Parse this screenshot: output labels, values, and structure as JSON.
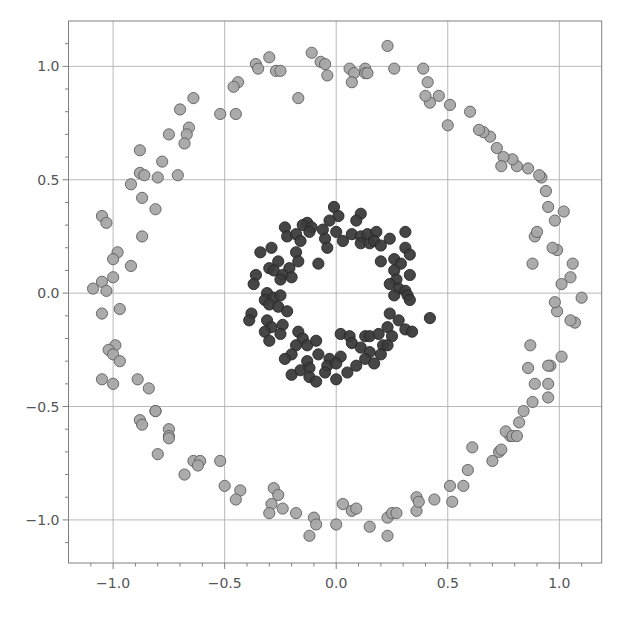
{
  "chart_data": {
    "type": "scatter",
    "title": "",
    "xlabel": "",
    "ylabel": "",
    "xlim": [
      -1.2,
      1.19
    ],
    "ylim": [
      -1.19,
      1.2
    ],
    "grid": true,
    "legend": null,
    "xticks": [
      -1.0,
      -0.5,
      0.0,
      0.5,
      1.0
    ],
    "xtick_labels": [
      "−1.0",
      "−0.5",
      "0.0",
      "0.5",
      "1.0"
    ],
    "yticks": [
      1.0,
      0.5,
      0.0,
      -0.5,
      -1.0
    ],
    "ytick_labels": [
      "1.0",
      "0.5",
      "0.0",
      "−0.5",
      "−1.0"
    ],
    "colors": {
      "outer": "#a6a6a6",
      "outer_edge": "#5e5e5e",
      "inner": "#3c3c3c",
      "inner_edge": "#262626",
      "grid": "#b0b0b0",
      "axis": "#808080",
      "tick_label": "#555555"
    },
    "series": [
      {
        "name": "outer circle",
        "points": [
          [
            -0.3,
            1.04
          ],
          [
            -0.11,
            1.06
          ],
          [
            -0.36,
            1.01
          ],
          [
            -0.35,
            0.99
          ],
          [
            -0.27,
            0.98
          ],
          [
            -0.25,
            0.98
          ],
          [
            -0.07,
            1.02
          ],
          [
            -0.05,
            1.01
          ],
          [
            -0.04,
            0.96
          ],
          [
            -0.17,
            0.86
          ],
          [
            -0.44,
            0.93
          ],
          [
            -0.46,
            0.91
          ],
          [
            -0.45,
            0.79
          ],
          [
            -0.52,
            0.79
          ],
          [
            -0.64,
            0.86
          ],
          [
            -0.7,
            0.81
          ],
          [
            -0.66,
            0.73
          ],
          [
            -0.67,
            0.7
          ],
          [
            -0.68,
            0.66
          ],
          [
            -0.75,
            0.7
          ],
          [
            -0.88,
            0.63
          ],
          [
            -0.78,
            0.58
          ],
          [
            -0.88,
            0.53
          ],
          [
            -0.86,
            0.52
          ],
          [
            -0.8,
            0.51
          ],
          [
            -0.71,
            0.52
          ],
          [
            -0.92,
            0.48
          ],
          [
            -0.87,
            0.42
          ],
          [
            -0.81,
            0.37
          ],
          [
            -1.05,
            0.34
          ],
          [
            -1.03,
            0.31
          ],
          [
            -0.87,
            0.25
          ],
          [
            -0.98,
            0.18
          ],
          [
            -1.0,
            0.15
          ],
          [
            -0.92,
            0.12
          ],
          [
            -1.0,
            0.07
          ],
          [
            -1.05,
            0.05
          ],
          [
            -1.09,
            0.02
          ],
          [
            -1.03,
            0.01
          ],
          [
            -0.97,
            -0.07
          ],
          [
            -1.05,
            -0.09
          ],
          [
            -0.99,
            -0.23
          ],
          [
            -1.02,
            -0.25
          ],
          [
            -1.0,
            -0.27
          ],
          [
            -0.97,
            -0.3
          ],
          [
            -1.05,
            -0.38
          ],
          [
            -1.0,
            -0.4
          ],
          [
            -0.89,
            -0.38
          ],
          [
            -0.84,
            -0.42
          ],
          [
            -0.81,
            -0.52
          ],
          [
            -0.81,
            -0.52
          ],
          [
            -0.88,
            -0.56
          ],
          [
            -0.87,
            -0.58
          ],
          [
            -0.75,
            -0.6
          ],
          [
            -0.75,
            -0.63
          ],
          [
            -0.75,
            -0.64
          ],
          [
            -0.8,
            -0.71
          ],
          [
            -0.64,
            -0.74
          ],
          [
            -0.61,
            -0.74
          ],
          [
            -0.62,
            -0.76
          ],
          [
            -0.52,
            -0.74
          ],
          [
            -0.68,
            -0.8
          ],
          [
            -0.5,
            -0.85
          ],
          [
            -0.43,
            -0.87
          ],
          [
            -0.45,
            -0.91
          ],
          [
            -0.28,
            -0.86
          ],
          [
            -0.26,
            -0.89
          ],
          [
            -0.29,
            -0.93
          ],
          [
            -0.3,
            -0.97
          ],
          [
            -0.24,
            -0.95
          ],
          [
            -0.18,
            -0.97
          ],
          [
            -0.1,
            -0.99
          ],
          [
            -0.09,
            -1.02
          ],
          [
            -0.12,
            -1.07
          ],
          [
            0.0,
            -1.02
          ],
          [
            0.03,
            -0.93
          ],
          [
            0.07,
            -0.96
          ],
          [
            0.09,
            -0.95
          ],
          [
            0.15,
            -1.03
          ],
          [
            0.23,
            -0.99
          ],
          [
            0.25,
            -0.97
          ],
          [
            0.27,
            -0.97
          ],
          [
            0.23,
            -1.07
          ],
          [
            0.36,
            -0.96
          ],
          [
            0.36,
            -0.9
          ],
          [
            0.37,
            -0.92
          ],
          [
            0.44,
            -0.91
          ],
          [
            0.51,
            -0.85
          ],
          [
            0.52,
            -0.92
          ],
          [
            0.57,
            -0.85
          ],
          [
            0.59,
            -0.78
          ],
          [
            0.61,
            -0.68
          ],
          [
            0.7,
            -0.74
          ],
          [
            0.73,
            -0.7
          ],
          [
            0.74,
            -0.69
          ],
          [
            0.78,
            -0.63
          ],
          [
            0.76,
            -0.61
          ],
          [
            0.79,
            -0.63
          ],
          [
            0.81,
            -0.63
          ],
          [
            0.82,
            -0.57
          ],
          [
            0.84,
            -0.52
          ],
          [
            0.88,
            -0.48
          ],
          [
            0.95,
            -0.46
          ],
          [
            0.95,
            -0.4
          ],
          [
            0.89,
            -0.4
          ],
          [
            0.86,
            -0.33
          ],
          [
            0.96,
            -0.32
          ],
          [
            1.01,
            -0.28
          ],
          [
            0.95,
            -0.32
          ],
          [
            0.87,
            -0.23
          ],
          [
            1.07,
            -0.13
          ],
          [
            1.05,
            -0.12
          ],
          [
            0.99,
            -0.08
          ],
          [
            0.98,
            -0.04
          ],
          [
            1.1,
            -0.02
          ],
          [
            1.01,
            0.04
          ],
          [
            1.05,
            0.07
          ],
          [
            1.06,
            0.13
          ],
          [
            0.88,
            0.13
          ],
          [
            0.99,
            0.19
          ],
          [
            0.97,
            0.2
          ],
          [
            0.89,
            0.25
          ],
          [
            0.9,
            0.27
          ],
          [
            0.98,
            0.32
          ],
          [
            1.02,
            0.36
          ],
          [
            0.95,
            0.38
          ],
          [
            0.94,
            0.45
          ],
          [
            0.92,
            0.51
          ],
          [
            0.91,
            0.52
          ],
          [
            0.86,
            0.55
          ],
          [
            0.81,
            0.56
          ],
          [
            0.79,
            0.59
          ],
          [
            0.75,
            0.6
          ],
          [
            0.74,
            0.56
          ],
          [
            0.72,
            0.64
          ],
          [
            0.69,
            0.69
          ],
          [
            0.66,
            0.71
          ],
          [
            0.64,
            0.72
          ],
          [
            0.6,
            0.8
          ],
          [
            0.51,
            0.83
          ],
          [
            0.46,
            0.87
          ],
          [
            0.42,
            0.84
          ],
          [
            0.4,
            0.87
          ],
          [
            0.5,
            0.74
          ],
          [
            0.41,
            0.93
          ],
          [
            0.39,
            0.99
          ],
          [
            0.26,
            0.99
          ],
          [
            0.13,
            0.99
          ],
          [
            0.23,
            1.09
          ],
          [
            0.06,
            0.99
          ],
          [
            0.08,
            0.97
          ],
          [
            0.13,
            0.97
          ],
          [
            0.14,
            0.97
          ],
          [
            0.07,
            0.93
          ]
        ]
      },
      {
        "name": "inner circle",
        "points": [
          [
            -0.01,
            0.38
          ],
          [
            0.01,
            0.34
          ],
          [
            -0.03,
            0.32
          ],
          [
            0.11,
            0.35
          ],
          [
            0.09,
            0.32
          ],
          [
            -0.13,
            0.31
          ],
          [
            -0.15,
            0.3
          ],
          [
            -0.23,
            0.29
          ],
          [
            -0.11,
            0.29
          ],
          [
            -0.06,
            0.28
          ],
          [
            -0.22,
            0.25
          ],
          [
            -0.18,
            0.26
          ],
          [
            -0.16,
            0.23
          ],
          [
            -0.12,
            0.27
          ],
          [
            -0.05,
            0.24
          ],
          [
            -0.04,
            0.2
          ],
          [
            0.0,
            0.27
          ],
          [
            0.03,
            0.23
          ],
          [
            0.07,
            0.26
          ],
          [
            0.11,
            0.25
          ],
          [
            0.14,
            0.26
          ],
          [
            0.18,
            0.27
          ],
          [
            0.24,
            0.24
          ],
          [
            0.31,
            0.27
          ],
          [
            0.11,
            0.22
          ],
          [
            0.15,
            0.22
          ],
          [
            0.17,
            0.23
          ],
          [
            0.2,
            0.21
          ],
          [
            0.31,
            0.2
          ],
          [
            0.33,
            0.17
          ],
          [
            -0.29,
            0.2
          ],
          [
            -0.34,
            0.18
          ],
          [
            -0.18,
            0.18
          ],
          [
            -0.17,
            0.14
          ],
          [
            -0.08,
            0.13
          ],
          [
            -0.26,
            0.14
          ],
          [
            0.2,
            0.14
          ],
          [
            0.26,
            0.15
          ],
          [
            0.29,
            0.13
          ],
          [
            0.26,
            0.1
          ],
          [
            0.33,
            0.08
          ],
          [
            -0.3,
            0.11
          ],
          [
            -0.28,
            0.1
          ],
          [
            -0.21,
            0.11
          ],
          [
            -0.24,
            0.08
          ],
          [
            -0.25,
            0.06
          ],
          [
            -0.2,
            0.07
          ],
          [
            -0.36,
            0.08
          ],
          [
            -0.37,
            0.04
          ],
          [
            0.27,
            0.06
          ],
          [
            0.24,
            0.04
          ],
          [
            0.28,
            0.02
          ],
          [
            0.31,
            0.01
          ],
          [
            0.26,
            -0.01
          ],
          [
            0.32,
            -0.01
          ],
          [
            0.33,
            -0.03
          ],
          [
            -0.31,
            0.0
          ],
          [
            -0.32,
            -0.03
          ],
          [
            -0.28,
            -0.02
          ],
          [
            -0.25,
            -0.01
          ],
          [
            -0.3,
            -0.05
          ],
          [
            -0.26,
            -0.06
          ],
          [
            -0.22,
            -0.08
          ],
          [
            -0.38,
            -0.09
          ],
          [
            -0.39,
            -0.12
          ],
          [
            0.24,
            -0.09
          ],
          [
            0.42,
            -0.11
          ],
          [
            -0.31,
            -0.12
          ],
          [
            -0.29,
            -0.15
          ],
          [
            -0.24,
            -0.14
          ],
          [
            -0.32,
            -0.17
          ],
          [
            -0.3,
            -0.21
          ],
          [
            -0.25,
            -0.18
          ],
          [
            0.28,
            -0.12
          ],
          [
            0.23,
            -0.15
          ],
          [
            0.31,
            -0.16
          ],
          [
            0.34,
            -0.17
          ],
          [
            0.25,
            -0.19
          ],
          [
            0.02,
            -0.18
          ],
          [
            0.06,
            -0.19
          ],
          [
            0.07,
            -0.22
          ],
          [
            0.13,
            -0.19
          ],
          [
            0.15,
            -0.19
          ],
          [
            0.19,
            -0.18
          ],
          [
            -0.17,
            -0.17
          ],
          [
            -0.15,
            -0.2
          ],
          [
            -0.13,
            -0.23
          ],
          [
            -0.09,
            -0.21
          ],
          [
            -0.18,
            -0.23
          ],
          [
            0.11,
            -0.24
          ],
          [
            0.15,
            -0.26
          ],
          [
            0.21,
            -0.23
          ],
          [
            0.23,
            -0.23
          ],
          [
            0.2,
            -0.27
          ],
          [
            -0.2,
            -0.27
          ],
          [
            -0.23,
            -0.29
          ],
          [
            -0.13,
            -0.3
          ],
          [
            -0.08,
            -0.27
          ],
          [
            -0.03,
            -0.29
          ],
          [
            0.02,
            -0.28
          ],
          [
            0.13,
            -0.29
          ],
          [
            0.17,
            -0.31
          ],
          [
            -0.2,
            -0.36
          ],
          [
            -0.16,
            -0.34
          ],
          [
            -0.12,
            -0.33
          ],
          [
            -0.04,
            -0.32
          ],
          [
            0.0,
            -0.31
          ],
          [
            0.09,
            -0.32
          ],
          [
            0.05,
            -0.35
          ],
          [
            -0.12,
            -0.37
          ],
          [
            -0.09,
            -0.39
          ],
          [
            -0.05,
            -0.35
          ],
          [
            0.0,
            -0.38
          ]
        ]
      }
    ]
  }
}
